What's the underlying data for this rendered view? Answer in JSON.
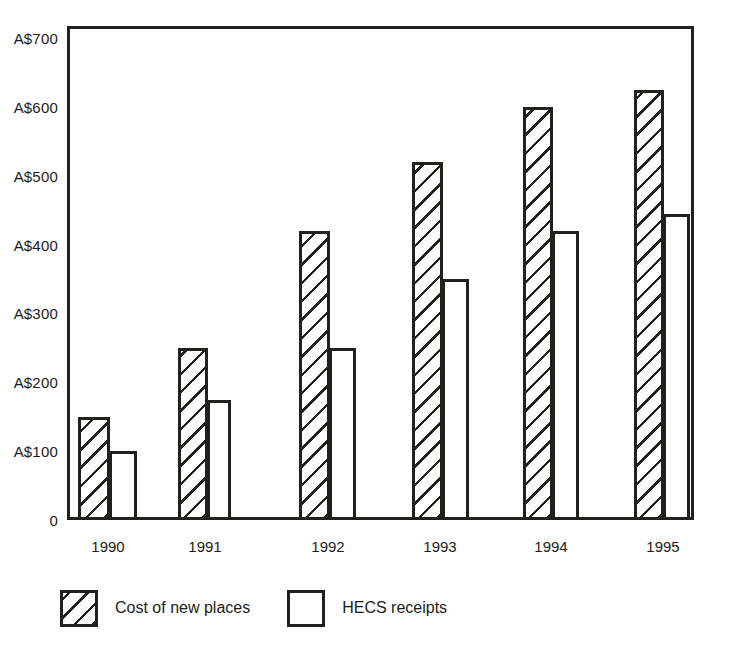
{
  "chart_data": {
    "type": "bar",
    "title": "",
    "subtitle": "",
    "xlabel": "",
    "ylabel": "",
    "categories": [
      "1990",
      "1991",
      "1992",
      "1993",
      "1994",
      "1995"
    ],
    "series": [
      {
        "name": "Cost of new places",
        "fill": "diagonal-hatch",
        "values": [
          150,
          250,
          420,
          520,
          600,
          625
        ]
      },
      {
        "name": "HECS receipts",
        "fill": "white",
        "values": [
          100,
          175,
          250,
          350,
          420,
          445
        ]
      }
    ],
    "ylim": [
      0,
      700
    ],
    "y_ticks": [
      0,
      100,
      200,
      300,
      400,
      500,
      600,
      700
    ],
    "y_tick_labels": [
      "0",
      "A$100",
      "A$200",
      "A$300",
      "A$400",
      "A$500",
      "A$600",
      "A$700"
    ],
    "grid": false,
    "legend_position": "bottom-left",
    "currency_prefix": "A$",
    "axis_color": "#20201c",
    "background_color": "#ffffff"
  },
  "legend": {
    "items": [
      {
        "label": "Cost of new places",
        "fill": "diagonal-hatch"
      },
      {
        "label": "HECS receipts",
        "fill": "white"
      }
    ]
  }
}
